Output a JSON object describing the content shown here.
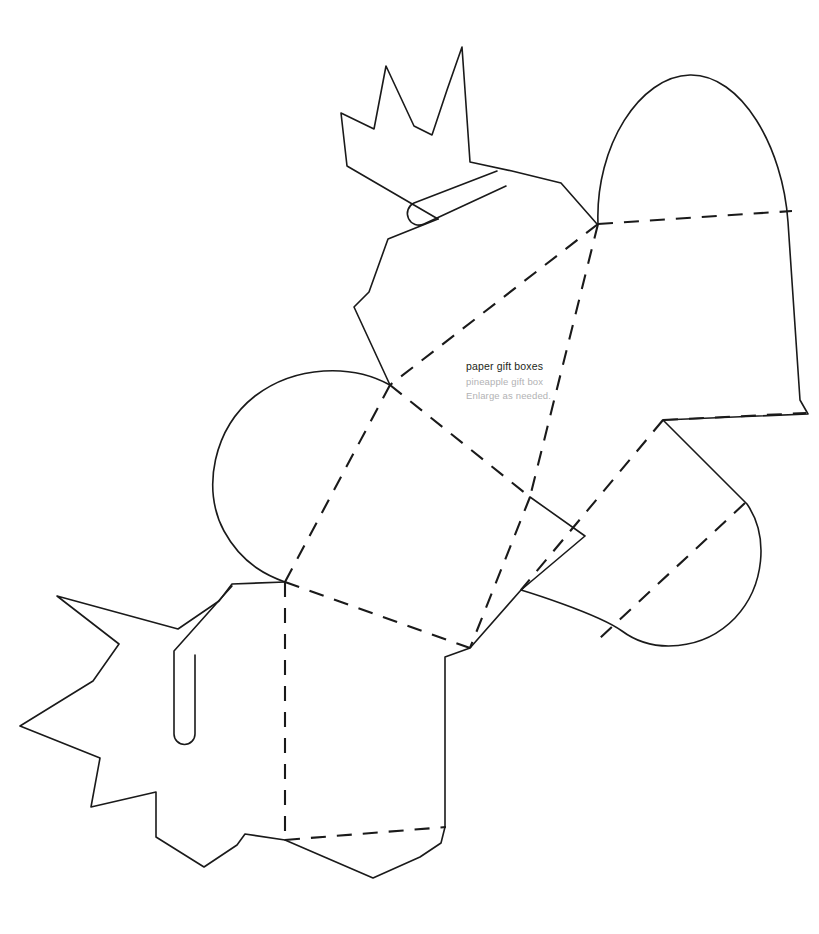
{
  "document": {
    "type": "printable-craft-template",
    "background_color": "#ffffff",
    "width": 819,
    "height": 934
  },
  "labels": {
    "title": "paper gift boxes",
    "subtitle": "pineapple gift box",
    "note": "Enlarge as needed.",
    "title_color": "#231f20",
    "subtitle_color": "#b2b2b4",
    "note_color": "#b2b2b4"
  },
  "line_styles": {
    "cut_line": {
      "name": "cut-line",
      "color": "#1a1a1a",
      "width": 1.5,
      "dash": "none"
    },
    "fold_line": {
      "name": "fold-line",
      "color": "#1a1a1a",
      "width": 2.0,
      "dash": "14,11"
    }
  },
  "shapes": {
    "crown_top": {
      "name": "pineapple-crown-top",
      "description": "Spiky pineapple leaf crown, upper-left, with rounded-end slot",
      "points": "347,166 340,114 373,128 385,67 414,125 431,134 446,90 462,47 470,161 512,170 560,182 597,224 556,196 497,161 459,200 438,219",
      "slot": "M 496,172 L 414,205 A 11,11 0 1 0 424,224 L 506,186"
    },
    "crown_bottom": {
      "name": "pineapple-crown-bottom",
      "description": "Spiky pineapple leaf crown, lower-left, with rounded-end slot",
      "points": "56,595 118,644 93,680 20,725 99,758 91,806 156,791 156,836 204,866 236,844 244,833 282,840 285,582 232,584 218,601 178,628",
      "slot": "M 232,586 L 174,650 L 174,735 A 10,10 0 1 0 194,735 L 194,654"
    },
    "dome_right": {
      "name": "dome-panel-right",
      "description": "Rounded dome-top lid panel, upper right",
      "path": "M 598,224 C 596,150 641,76 690,75 C 740,74 782,148 787,222 L 808,414 L 663,420"
    },
    "dome_left": {
      "name": "dome-panel-left",
      "description": "Rounded dome tab, middle left",
      "path": "M 285,582 C 222,560 202,486 210,432 C 218,378 268,362 313,374 C 358,387 390,385 390,385"
    },
    "dome_lower_right": {
      "name": "dome-tab-lower-right",
      "description": "Rounded dome tab, lower right",
      "path": "M 663,420 C 718,444 762,498 757,545 C 752,592 701,646 645,648 C 593,650 545,620 521,590"
    },
    "fold_lines": [
      {
        "name": "fold-top-right-horizontal",
        "path": "M 598,224 L 790,211"
      },
      {
        "name": "fold-right-lower-horizontal",
        "path": "M 663,420 L 808,414"
      },
      {
        "name": "fold-crown-to-center",
        "path": "M 598,224 L 530,497"
      },
      {
        "name": "fold-upper-diagonal",
        "path": "M 598,224 L 390,385"
      },
      {
        "name": "fold-left-diagonal",
        "path": "M 390,385 L 285,582"
      },
      {
        "name": "fold-center-diagonal",
        "path": "M 390,385 L 530,497"
      },
      {
        "name": "fold-center-to-bottom",
        "path": "M 530,497 L 470,648"
      },
      {
        "name": "fold-left-to-bottom",
        "path": "M 285,582 L 470,648"
      },
      {
        "name": "fold-bottom-vertical",
        "path": "M 285,582 L 285,840"
      },
      {
        "name": "fold-bottom-horizontal",
        "path": "M 285,840 L 444,827"
      },
      {
        "name": "fold-lower-right-diagonal",
        "path": "M 663,420 L 521,590"
      },
      {
        "name": "fold-dome-lower-right-tab",
        "path": "M 742,524 L 601,637"
      }
    ],
    "panel_edges": [
      {
        "name": "edge-center-right-panel",
        "path": "M 530,497 L 584,535 L 521,590 L 470,648 L 444,656 L 444,827"
      },
      {
        "name": "edge-bottom-panel-right",
        "path": "M 444,827 L 440,843 L 419,856 L 373,877 L 285,840"
      }
    ]
  }
}
